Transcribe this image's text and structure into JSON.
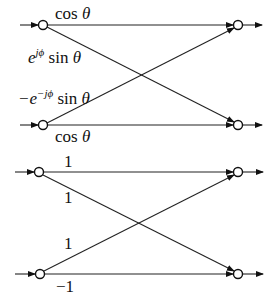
{
  "diagrams": [
    {
      "name": "givens-rotation-butterfly",
      "labels": {
        "top_straight": "cos",
        "top_straight_var": "θ",
        "top_cross_base": "e",
        "top_cross_sup": "jϕ",
        "top_cross_fn": " sin",
        "top_cross_var": "θ",
        "bottom_cross_prefix": "−e",
        "bottom_cross_sup": "−jϕ",
        "bottom_cross_fn": " sin",
        "bottom_cross_var": "θ",
        "bottom_straight": "cos",
        "bottom_straight_var": "θ"
      }
    },
    {
      "name": "hadamard-butterfly",
      "labels": {
        "top_straight": "1",
        "top_cross": "1",
        "bottom_cross": "1",
        "bottom_straight": "−1"
      }
    }
  ]
}
